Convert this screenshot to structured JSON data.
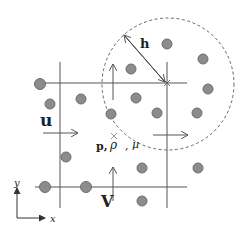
{
  "diagram": {
    "title": "",
    "labels": {
      "h": "h",
      "u": "u",
      "v": "V",
      "p": "p,",
      "rho": "ρ",
      "comma": ",",
      "mu": "μ",
      "axis_x": "x",
      "axis_y": "y"
    },
    "colors": {
      "particle_fill": "#8c8c8c",
      "particle_stroke": "#6e6e6e",
      "grid_line": "#555555",
      "circle_dash": "#666666",
      "text": "#222222"
    },
    "particles": [
      {
        "x": 40,
        "y": 84
      },
      {
        "x": 50,
        "y": 104
      },
      {
        "x": 81,
        "y": 99
      },
      {
        "x": 111,
        "y": 114
      },
      {
        "x": 131,
        "y": 69
      },
      {
        "x": 172,
        "y": 44
      },
      {
        "x": 203,
        "y": 58
      },
      {
        "x": 207,
        "y": 89
      },
      {
        "x": 136,
        "y": 98
      },
      {
        "x": 157,
        "y": 113
      },
      {
        "x": 196,
        "y": 113
      },
      {
        "x": 66,
        "y": 157
      },
      {
        "x": 141,
        "y": 167
      },
      {
        "x": 198,
        "y": 167
      },
      {
        "x": 45,
        "y": 187
      },
      {
        "x": 86,
        "y": 187
      },
      {
        "x": 141,
        "y": 201
      }
    ]
  }
}
